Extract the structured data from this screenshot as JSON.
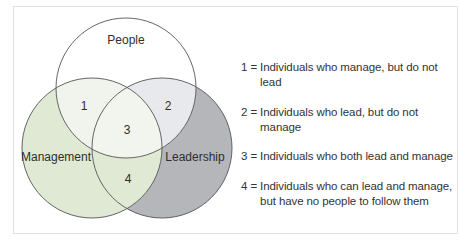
{
  "diagram": {
    "type": "venn",
    "sets": [
      {
        "id": "people",
        "label": "People",
        "fill": "#ffffff"
      },
      {
        "id": "management",
        "label": "Management",
        "fill": "#dfe9d3"
      },
      {
        "id": "leadership",
        "label": "Leadership",
        "fill": "#b4b6ba"
      }
    ],
    "regions": [
      {
        "id": "1",
        "label": "1",
        "sets": [
          "people",
          "management"
        ],
        "fill": "#f0f4ec"
      },
      {
        "id": "2",
        "label": "2",
        "sets": [
          "people",
          "leadership"
        ],
        "fill": "#e8e9ed"
      },
      {
        "id": "3",
        "label": "3",
        "sets": [
          "people",
          "management",
          "leadership"
        ],
        "fill": "#f1f5ee"
      },
      {
        "id": "4",
        "label": "4",
        "sets": [
          "management",
          "leadership"
        ],
        "fill": "#dfe9d3"
      }
    ],
    "colors": {
      "stroke": "#555555",
      "frame_border": "#e2e4e0",
      "text": "#2e2e2e"
    }
  },
  "legend": {
    "items": [
      {
        "num": "1 = ",
        "text": "Individuals who manage, but do not lead"
      },
      {
        "num": "2 = ",
        "text": "Individuals who lead, but do not manage"
      },
      {
        "num": "3 = ",
        "text": "Individuals who both lead and manage"
      },
      {
        "num": "4 = ",
        "text": "Individuals who can lead and manage,",
        "text2": "but have no people to follow them"
      }
    ]
  }
}
